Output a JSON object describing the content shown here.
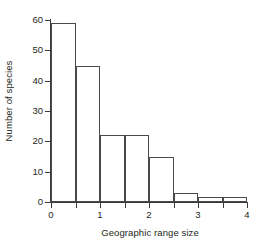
{
  "chart_data": {
    "type": "bar",
    "title": "",
    "xlabel": "Geographic range size",
    "ylabel": "Number of species",
    "categories": [
      "0-0.5",
      "0.5-1",
      "1-1.5",
      "1.5-2",
      "2-2.5",
      "2.5-3",
      "3-3.5",
      "3.5-4"
    ],
    "bin_edges": [
      0,
      0.5,
      1,
      1.5,
      2,
      2.5,
      3,
      3.5,
      4
    ],
    "values": [
      59,
      45,
      22,
      22,
      15,
      3,
      1.5,
      1.5
    ],
    "xlim": [
      0,
      4
    ],
    "ylim": [
      0,
      60
    ],
    "xticks": [
      0,
      1,
      2,
      3,
      4
    ],
    "xtick_labels": [
      "0",
      "1",
      "2",
      "3",
      "4"
    ],
    "xminorticks": [
      0.5,
      1.5,
      2.5,
      3.5
    ],
    "yticks": [
      0,
      10,
      20,
      30,
      40,
      50,
      60
    ],
    "ytick_labels": [
      "0",
      "10",
      "20",
      "30",
      "40",
      "50",
      "60"
    ],
    "grid": false,
    "legend": null,
    "bar_fill_color": "#ffffff",
    "bar_edge_color": "#4a4a4a",
    "axis_color": "#3b3b3b",
    "background_color": "#ffffff",
    "text_color": "#231f20"
  }
}
